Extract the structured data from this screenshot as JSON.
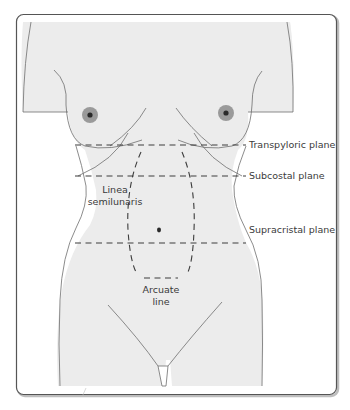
{
  "diagram": {
    "colors": {
      "skin_fill": "#ececec",
      "outline": "#6e6e6e",
      "dash": "#3c3c3c",
      "areola": "#9a9a9a",
      "nipple": "#2a2a2a",
      "frame": "#555555",
      "text": "#3a3a3a"
    },
    "planes": [
      {
        "id": "transpyloric",
        "label": "Transpyloric plane"
      },
      {
        "id": "subcostal",
        "label": "Subcostal plane"
      },
      {
        "id": "supracristal",
        "label": "Supracristal plane"
      }
    ],
    "lines": [
      {
        "id": "linea-semilunaris",
        "label_line1": "Linea",
        "label_line2": "semilunaris"
      },
      {
        "id": "arcuate-line",
        "label_line1": "Arcuate",
        "label_line2": "line"
      }
    ],
    "features": [
      "left-nipple",
      "right-nipple",
      "umbilicus",
      "costal-margin",
      "inguinal-ligament"
    ]
  }
}
